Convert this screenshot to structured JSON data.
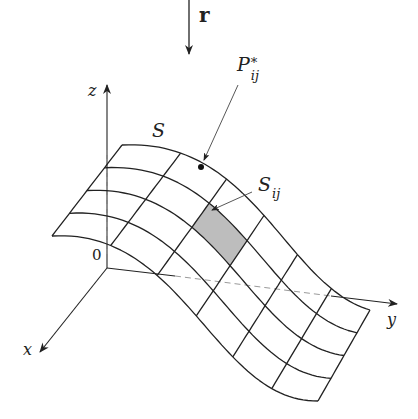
{
  "diagram": {
    "mapping_label": "r",
    "axes": {
      "x": "x",
      "y": "y",
      "z": "z",
      "origin": "0"
    },
    "surface_label": "S",
    "point_label": {
      "base": "P",
      "sub": "ij",
      "sup": "*"
    },
    "patch_label": {
      "base": "S",
      "sub": "ij"
    },
    "grid": {
      "rows": 4,
      "cols": 6
    },
    "colors": {
      "line": "#222222",
      "patch_fill": "#bdbdbd",
      "dashed": "#9a9a9a"
    }
  }
}
